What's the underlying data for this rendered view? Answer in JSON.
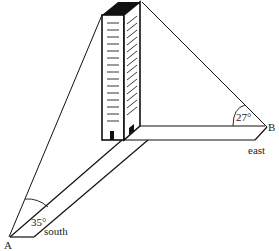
{
  "diagram": {
    "type": "geometry-word-problem",
    "points": [
      {
        "id": "A",
        "label": "A"
      },
      {
        "id": "B",
        "label": "B"
      }
    ],
    "directions": {
      "south": "south",
      "east": "east"
    },
    "angles": {
      "at_A": "35°",
      "at_B": "27°"
    },
    "colors": {
      "line": "#111111",
      "roof": "#111111",
      "background": "#ffffff"
    }
  }
}
